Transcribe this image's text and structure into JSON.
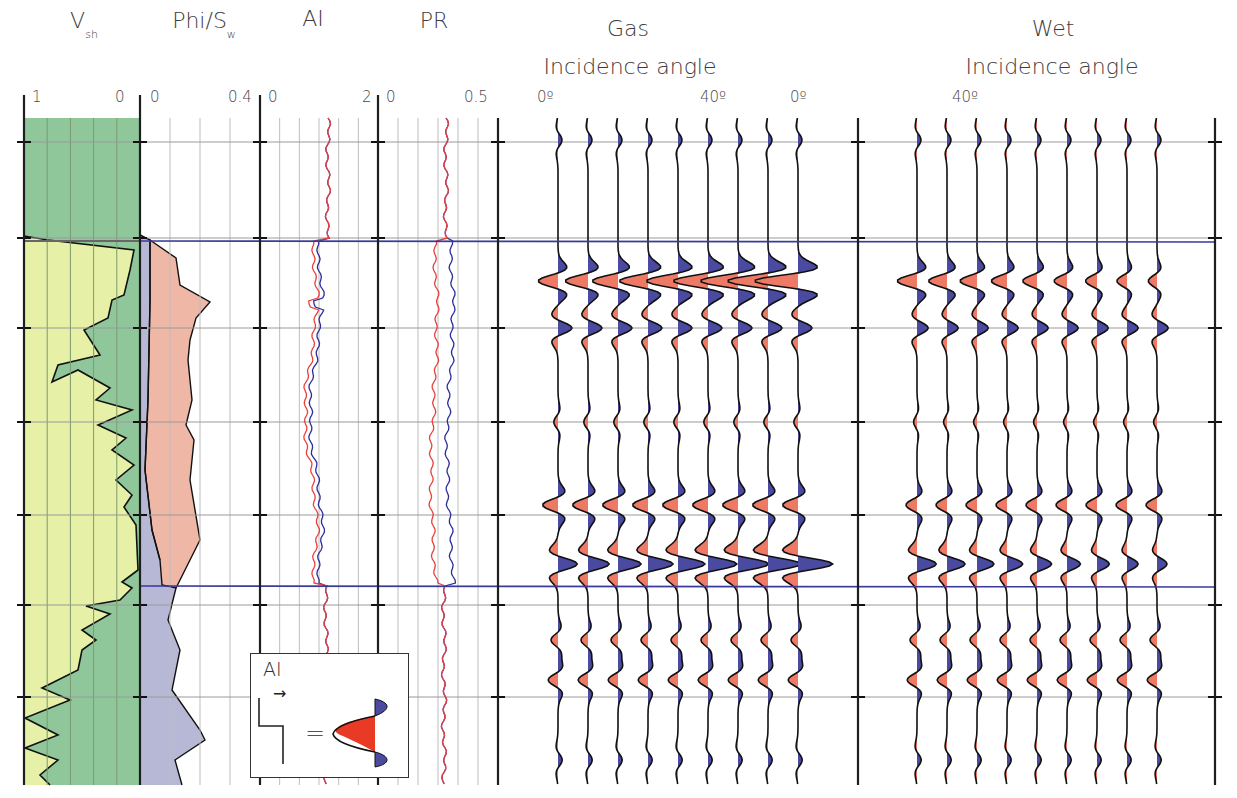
{
  "headers": {
    "vsh": {
      "main": "V",
      "sub": "sh"
    },
    "phi_sw": {
      "main": "Phi/S",
      "sub": "w"
    },
    "ai": "AI",
    "pr": "PR",
    "gas": {
      "line1": "Gas",
      "line2": "Incidence angle"
    },
    "wet": {
      "line1": "Wet",
      "line2": "Incidence angle"
    }
  },
  "scales": {
    "vsh": {
      "left": "1",
      "right": "0"
    },
    "phi_sw": {
      "left": "0",
      "right": "0.4"
    },
    "ai": {
      "left": "0",
      "right": "2"
    },
    "pr": {
      "left": "0",
      "right": "0.5"
    },
    "gas": {
      "left": "0º",
      "right": "40º"
    },
    "wet": {
      "left": "0º",
      "right": "40º"
    }
  },
  "legend": {
    "label": "AI",
    "arrow": "→",
    "equals": "=",
    "description": "Step increase in AI produces red-centred trough with blue side lobes"
  },
  "colors": {
    "vsh_shale": "#8fc79a",
    "vsh_sand": "#e6f0a6",
    "phi_fill": "#efb7a6",
    "sw_fill": "#b7b8d6",
    "wiggle_red": "#ee7a66",
    "wiggle_blue": "#4a4aa0",
    "log_red": "#e8413c",
    "log_blue": "#2c2c9c",
    "horizon": "#3a3a9a",
    "grid": "#bdbdbd",
    "track_border": "#1e1e1e"
  },
  "chart_data": {
    "type": "well-log-with-avo-synthetics",
    "title": "",
    "depth_axis": {
      "top_px": 118,
      "bottom_px": 785,
      "gridlines_px": [
        142,
        238,
        328,
        422,
        515,
        605,
        697
      ]
    },
    "horizons_px": [
      241,
      586
    ],
    "tracks": [
      {
        "name": "Vsh",
        "range": [
          1,
          0
        ],
        "fill_left": "sand",
        "fill_right": "shale",
        "notes": "Shale (Vsh≈1) above top horizon; sand-rich interval between horizons; mixed below"
      },
      {
        "name": "Phi/Sw",
        "range": [
          0,
          0.4
        ],
        "notes": "Porosity up to ~0.28 within reservoir; water saturation low in gas zone"
      },
      {
        "name": "AI",
        "range": [
          0,
          2
        ],
        "series": [
          "gas (red)",
          "wet (blue)"
        ],
        "notes": "AI ≈1.3 above; drops to ~1.0-1.15 in gas sand, slightly less drop for wet case"
      },
      {
        "name": "PR",
        "range": [
          0,
          0.5
        ],
        "series": [
          "gas (red)",
          "wet (blue)"
        ],
        "notes": "PR ≈0.3 above; ~0.2 in gas sand (red), ~0.3 wet (blue)"
      },
      {
        "name": "Gas synthetic gather",
        "angles_deg": [
          0,
          5,
          10,
          15,
          20,
          25,
          30,
          35,
          40
        ],
        "traces": 9,
        "notes": "Strong amplitudes at reservoir top/base, amplitude brightening with angle"
      },
      {
        "name": "Wet synthetic gather",
        "angles_deg": [
          0,
          5,
          10,
          15,
          20,
          25,
          30,
          35,
          40
        ],
        "traces": 9,
        "notes": "Weaker amplitudes, dimming with angle"
      }
    ],
    "legend": [
      "AI step increase → red peak with blue side lobes"
    ]
  }
}
